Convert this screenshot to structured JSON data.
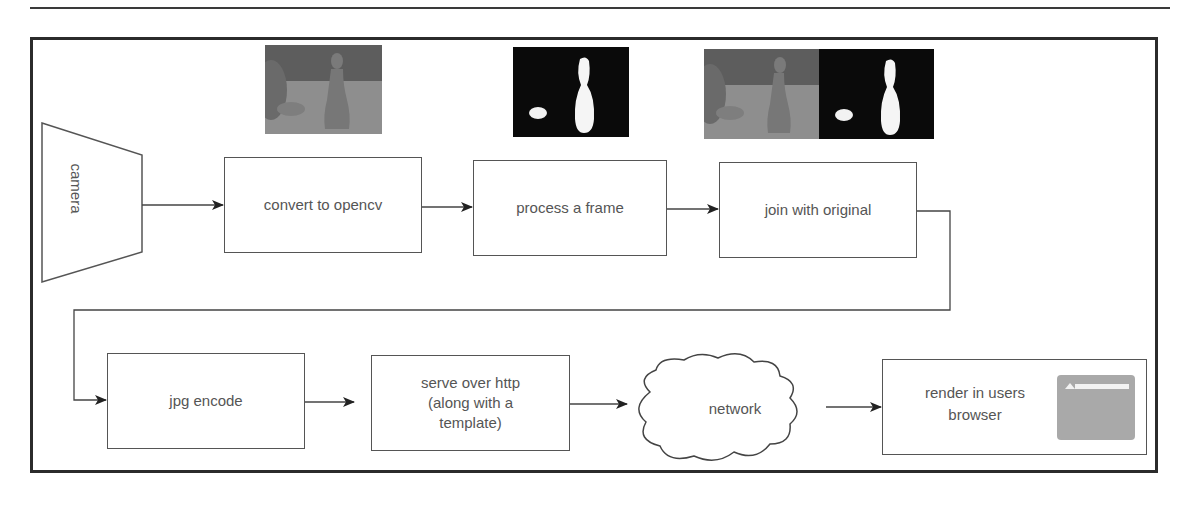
{
  "diagram": {
    "title": "",
    "nodes": [
      {
        "id": "camera",
        "label": "camera",
        "shape": "trapezoid"
      },
      {
        "id": "convert",
        "label": "convert to opencv",
        "shape": "rectangle"
      },
      {
        "id": "process",
        "label": "process a frame",
        "shape": "rectangle"
      },
      {
        "id": "join",
        "label": "join with original",
        "shape": "rectangle"
      },
      {
        "id": "encode",
        "label": "jpg encode",
        "shape": "rectangle"
      },
      {
        "id": "serve",
        "label_lines": [
          "serve over http",
          "(along with a",
          "template)"
        ],
        "shape": "rectangle"
      },
      {
        "id": "network",
        "label": "network",
        "shape": "cloud"
      },
      {
        "id": "render",
        "label_lines": [
          "render in users",
          "browser"
        ],
        "shape": "rectangle",
        "icon": "browser-window-icon"
      }
    ],
    "edges": [
      {
        "from": "camera",
        "to": "convert"
      },
      {
        "from": "convert",
        "to": "process"
      },
      {
        "from": "process",
        "to": "join"
      },
      {
        "from": "join",
        "to": "encode"
      },
      {
        "from": "encode",
        "to": "serve"
      },
      {
        "from": "serve",
        "to": "network"
      },
      {
        "from": "network",
        "to": "render"
      }
    ],
    "thumbnails": [
      {
        "above": "convert",
        "content": "original-frame-image"
      },
      {
        "above": "process",
        "content": "binary-mask-image"
      },
      {
        "above": "join",
        "content": "side-by-side-original-and-mask-image"
      }
    ]
  },
  "colors": {
    "border": "#2b2b2b",
    "box_stroke": "#555555",
    "text": "#555555",
    "mask_bg": "#0a0a0a",
    "photo_gray": "#8c8c8c"
  }
}
